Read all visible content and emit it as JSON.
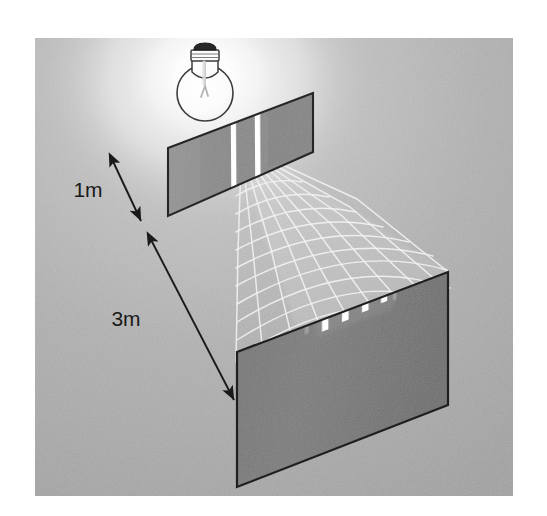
{
  "figure": {
    "type": "physics-optics-diagram",
    "background_color": "#ffffff",
    "panel_color": "#b0b0b0",
    "panel_rect": {
      "x": 35,
      "y": 38,
      "width": 478,
      "height": 458
    }
  },
  "light_source": {
    "name": "light-bulb",
    "label": "",
    "cap_color": "#2b2b2b",
    "glass_color": "#fbfbfb",
    "outline_color": "#3a3a3a",
    "center_x": 205,
    "center_y": 78,
    "glow_color": "#ffffff"
  },
  "barrier": {
    "name": "double-slit-barrier",
    "label": "",
    "fill_color": "#8c8c8c",
    "edge_color": "#2a2a2a",
    "slit_color": "#ffffff",
    "slit_count": 2,
    "corners": "168,148 313,93 313,152 168,216"
  },
  "screen": {
    "name": "detection-screen",
    "label": "",
    "fill_color": "#7a7a7a",
    "edge_color": "#222222",
    "corners": "237,352 448,272 448,405 237,487",
    "fringe_color": "#ffffff",
    "fringe_count": 4,
    "faint_fringe_count": 2
  },
  "wave_pattern": {
    "name": "interference-wavefronts",
    "stroke_color": "#f2f2f2",
    "ray_count": 11,
    "arc_count": 11
  },
  "dimensions": [
    {
      "id": "slit-distance",
      "value": "1m",
      "label_x": 88,
      "label_y": 197,
      "arrow_from": {
        "x": 108,
        "y": 152
      },
      "arrow_to": {
        "x": 143,
        "y": 224
      },
      "color": "#1a1a1a"
    },
    {
      "id": "screen-distance",
      "value": "3m",
      "label_x": 126,
      "label_y": 326,
      "arrow_from": {
        "x": 146,
        "y": 231
      },
      "arrow_to": {
        "x": 236,
        "y": 403
      },
      "color": "#1a1a1a"
    }
  ]
}
